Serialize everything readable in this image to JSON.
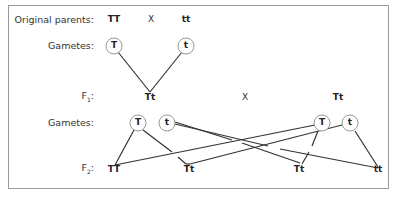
{
  "labels": {
    "original_parents": "Original parents:",
    "gametes_p": "Gametes:",
    "f1": "F",
    "f1_sub": "1",
    "f1_colon": ":",
    "gametes_f1": "Gametes:",
    "f2": "F",
    "f2_sub": "2",
    "f2_colon": ":"
  },
  "parents": {
    "left": "TT",
    "cross": "X",
    "right": "tt"
  },
  "parent_gametes": {
    "left": "T",
    "right": "t"
  },
  "f1": {
    "left": "Tt",
    "cross": "X",
    "right": "Tt"
  },
  "f1_gametes": {
    "left_T": "T",
    "left_t": "t",
    "right_T": "T",
    "right_t": "t"
  },
  "f2": [
    "TT",
    "Tt",
    "Tt",
    "tt"
  ],
  "colors": {
    "line": "#333333",
    "circle": "#999999",
    "frame": "#9a9a9a"
  }
}
